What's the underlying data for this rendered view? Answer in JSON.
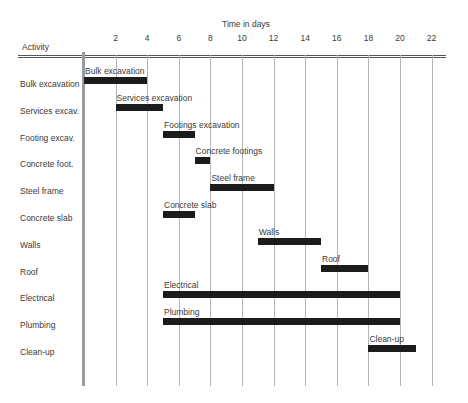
{
  "chart_data": {
    "type": "gantt",
    "title": "",
    "xlabel": "Time in days",
    "ylabel": "Activity",
    "xlim": [
      0,
      23
    ],
    "x_ticks": [
      2,
      4,
      6,
      8,
      10,
      12,
      14,
      16,
      18,
      20,
      22
    ],
    "grid": true,
    "tasks": [
      {
        "activity": "Bulk excavation",
        "bar_label": "Bulk excavation",
        "start": 0,
        "end": 4
      },
      {
        "activity": "Services excav.",
        "bar_label": "Services excavation",
        "start": 2,
        "end": 5
      },
      {
        "activity": "Footing excav.",
        "bar_label": "Footings excavation",
        "start": 5,
        "end": 7
      },
      {
        "activity": "Concrete foot.",
        "bar_label": "Concrete footings",
        "start": 7,
        "end": 8
      },
      {
        "activity": "Steel frame",
        "bar_label": "Steel frame",
        "start": 8,
        "end": 12
      },
      {
        "activity": "Concrete slab",
        "bar_label": "Concrete slab",
        "start": 5,
        "end": 7
      },
      {
        "activity": "Walls",
        "bar_label": "Walls",
        "start": 11,
        "end": 15
      },
      {
        "activity": "Roof",
        "bar_label": "Roof",
        "start": 15,
        "end": 18
      },
      {
        "activity": "Electrical",
        "bar_label": "Electrical",
        "start": 5,
        "end": 20
      },
      {
        "activity": "Plumbing",
        "bar_label": "Plumbing",
        "start": 5,
        "end": 20
      },
      {
        "activity": "Clean-up",
        "bar_label": "Clean-up",
        "start": 18,
        "end": 21
      }
    ],
    "colors": {
      "bar": "#1c1c1c",
      "grid": "#b5b5b5",
      "text": "#3a3a3a"
    }
  }
}
